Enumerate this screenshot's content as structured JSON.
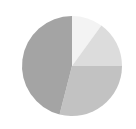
{
  "chart_data": {
    "type": "pie",
    "title": "",
    "categories": [
      "Slice 1",
      "Slice 2",
      "Slice 3",
      "Slice 4"
    ],
    "values": [
      10,
      15,
      29,
      46
    ],
    "colors": [
      "#f3f3f3",
      "#dcdcdc",
      "#c2c2c2",
      "#a4a4a4"
    ],
    "start_angle_deg": 90,
    "direction": "clockwise",
    "legend": "none",
    "labels_shown": false
  },
  "layout": {
    "cx": 72,
    "cy": 66,
    "r": 50
  }
}
